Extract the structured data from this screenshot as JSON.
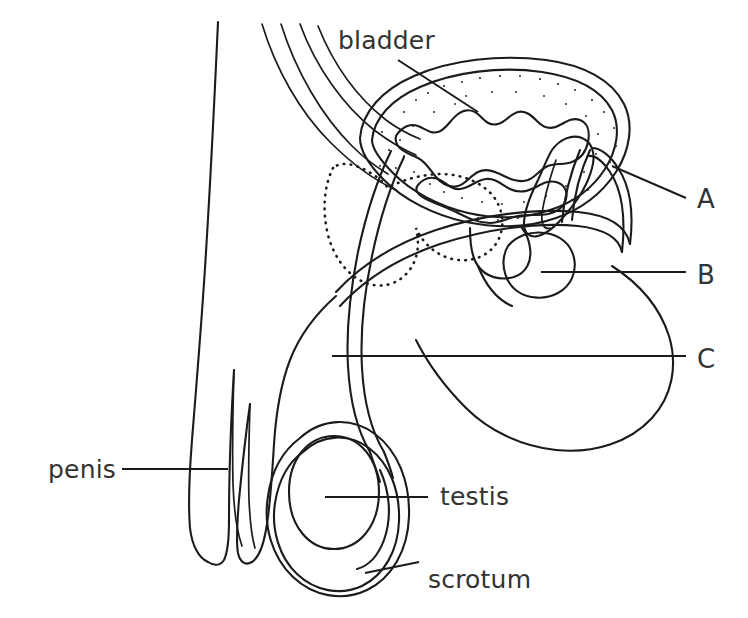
{
  "figure": {
    "type": "labelled-anatomical-line-diagram",
    "background_color": "#ffffff",
    "line_color": "#1b1b1b",
    "text_color": "#333333",
    "width": 748,
    "height": 618
  },
  "labels": {
    "bladder": "bladder",
    "penis": "penis",
    "testis": "testis",
    "scrotum": "scrotum",
    "a": "A",
    "b": "B",
    "c": "C"
  },
  "label_positions": {
    "bladder": {
      "x": 338,
      "y": 49
    },
    "penis": {
      "x": 48,
      "y": 478
    },
    "testis": {
      "x": 440,
      "y": 505
    },
    "scrotum": {
      "x": 428,
      "y": 588
    },
    "a": {
      "x": 697,
      "y": 208
    },
    "b": {
      "x": 697,
      "y": 284
    },
    "c": {
      "x": 697,
      "y": 368
    }
  },
  "leader_lines": [
    {
      "name": "bladder-leader",
      "from": {
        "x": 398,
        "y": 60
      },
      "to": {
        "x": 478,
        "y": 112
      }
    },
    {
      "name": "penis-leader",
      "from": {
        "x": 122,
        "y": 469
      },
      "to": {
        "x": 228,
        "y": 469
      }
    },
    {
      "name": "testis-leader",
      "from": {
        "x": 325,
        "y": 497
      },
      "to": {
        "x": 428,
        "y": 497
      }
    },
    {
      "name": "scrotum-leader",
      "from": {
        "x": 365,
        "y": 573
      },
      "to": {
        "x": 419,
        "y": 562
      }
    },
    {
      "name": "a-leader",
      "from": {
        "x": 612,
        "y": 166
      },
      "to": {
        "x": 686,
        "y": 198
      }
    },
    {
      "name": "b-leader",
      "from": {
        "x": 541,
        "y": 272
      },
      "to": {
        "x": 686,
        "y": 272
      }
    },
    {
      "name": "c-leader",
      "from": {
        "x": 332,
        "y": 356
      },
      "to": {
        "x": 686,
        "y": 356
      }
    }
  ],
  "unlabelled_structures": [
    "body-outline",
    "ureters",
    "pubic-bone",
    "bladder-wall",
    "bladder-lumen",
    "urethra",
    "vas-deferens",
    "seminal-vesicle",
    "prostate",
    "epididymis",
    "penile-shaft",
    "glans",
    "scrotal-sac",
    "testis-oval"
  ]
}
